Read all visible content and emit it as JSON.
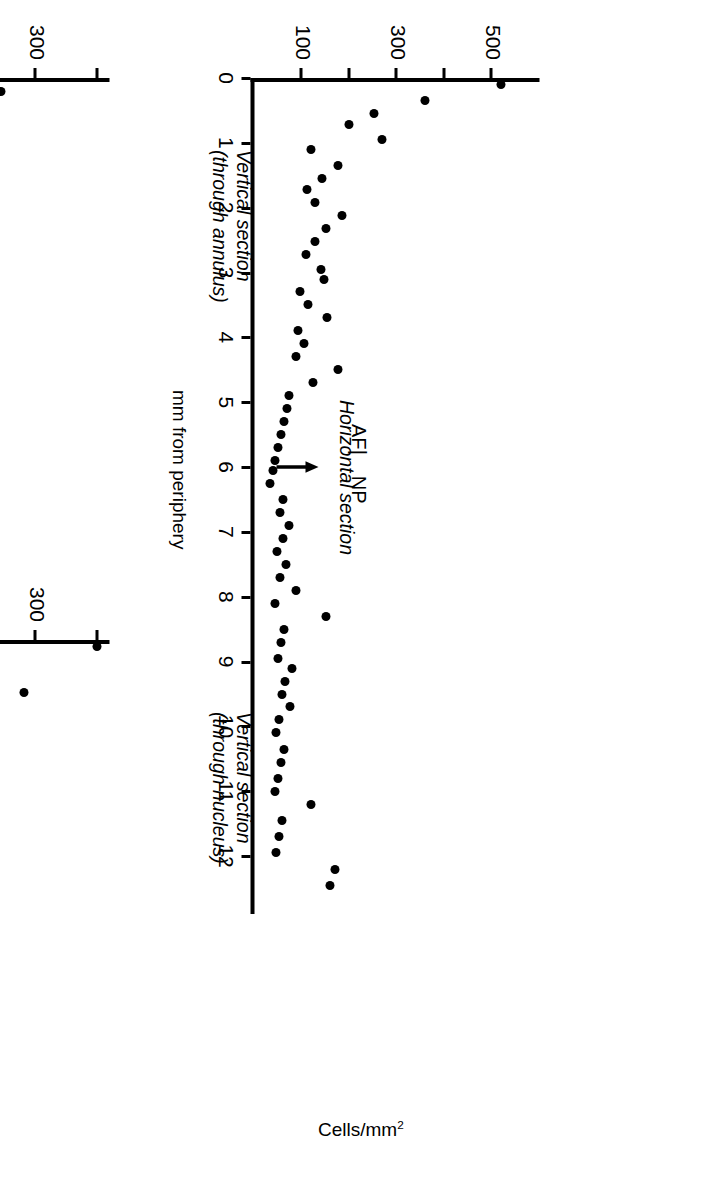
{
  "figure": {
    "global_y_axis_label": "Cells/mm",
    "global_y_axis_label_sup": "2",
    "x_axis_label": "mm from periphery"
  },
  "chart_data": [
    {
      "id": "vertical-annulus",
      "type": "scatter",
      "title": "Vertical section\n(through annulus)",
      "title_line1": "Vertical section",
      "title_line2": "(through annulus)",
      "xlabel": "",
      "ylabel": "Cells/mm2",
      "xlim": [
        0,
        5.2
      ],
      "ylim": [
        0,
        420
      ],
      "xticks": [
        0,
        1,
        2,
        3,
        4,
        5
      ],
      "xticklabels": [
        "0",
        "1",
        "2",
        "3",
        "4",
        "5"
      ],
      "yticks": [
        100,
        200,
        300,
        400
      ],
      "yticklabels": [
        "100",
        "",
        "300",
        ""
      ],
      "grid": false,
      "legend": false,
      "annotations": [
        {
          "text": "CP",
          "x": 0.72,
          "y": 150,
          "name": "cp-label"
        },
        {
          "text": "AF",
          "x": 1.3,
          "y": 150,
          "name": "af-label"
        },
        {
          "text": "arrow",
          "x": 1.0,
          "y": 95,
          "name": "boundary-arrow"
        }
      ],
      "x": [
        0.25,
        0.4,
        0.55,
        0.72,
        0.92,
        1.1,
        1.25,
        1.35,
        1.48,
        1.62,
        1.78,
        1.95,
        2.1,
        2.25,
        2.42,
        2.6,
        2.78,
        2.95,
        3.12,
        3.3,
        3.48,
        3.65,
        3.82,
        4.0,
        4.18,
        4.35,
        4.52,
        4.7
      ],
      "y": [
        245,
        148,
        143,
        128,
        118,
        110,
        72,
        75,
        78,
        82,
        86,
        95,
        58,
        62,
        66,
        70,
        74,
        78,
        62,
        66,
        70,
        74,
        66,
        50,
        54,
        58,
        62,
        66
      ],
      "values": [
        245,
        148,
        143,
        128,
        118,
        110,
        72,
        75,
        78,
        82,
        86,
        95,
        58,
        62,
        66,
        70,
        74,
        78,
        62,
        66,
        70,
        74,
        66,
        50,
        54,
        58,
        62,
        66
      ]
    },
    {
      "id": "vertical-nucleus",
      "type": "scatter",
      "title": "Vertical section\n(through nucleus)",
      "title_line1": "Vertical section",
      "title_line2": "(through nucleus)",
      "xlabel": "",
      "ylabel": "Cells/mm2",
      "xlim": [
        0,
        5.2
      ],
      "ylim": [
        0,
        420
      ],
      "xticks": [
        0,
        1,
        2,
        3,
        4,
        5
      ],
      "xticklabels": [
        "0",
        "1",
        "2",
        "3",
        "4",
        "5"
      ],
      "yticks": [
        100,
        200,
        300,
        400
      ],
      "yticklabels": [
        "100",
        "",
        "300",
        ""
      ],
      "grid": false,
      "legend": false,
      "annotations": [
        {
          "text": "CP",
          "x": 0.7,
          "y": 160,
          "name": "cp-label"
        },
        {
          "text": "NP",
          "x": 1.38,
          "y": 160,
          "name": "np-label"
        },
        {
          "text": "arrow",
          "x": 1.0,
          "y": 100,
          "name": "boundary-arrow"
        }
      ],
      "x": [
        0.12,
        0.42,
        0.55,
        0.68,
        0.95,
        1.28,
        1.48,
        1.72,
        1.95,
        2.12,
        2.32,
        2.52,
        2.78,
        2.82,
        3.02,
        3.42,
        3.55,
        3.8,
        4.0,
        4.18,
        4.38,
        4.55,
        4.75
      ],
      "y": [
        400,
        218,
        218,
        218,
        282,
        152,
        122,
        95,
        62,
        78,
        60,
        68,
        56,
        82,
        92,
        188,
        72,
        84,
        96,
        88,
        78,
        60,
        70
      ],
      "values": [
        400,
        218,
        218,
        218,
        282,
        152,
        122,
        95,
        62,
        78,
        60,
        68,
        56,
        82,
        92,
        188,
        72,
        84,
        96,
        88,
        78,
        60,
        70
      ]
    },
    {
      "id": "horizontal-section",
      "type": "scatter",
      "title": "Horizontal section",
      "title_line1": "Horizontal section",
      "title_line2": "",
      "xlabel": "mm from periphery",
      "ylabel": "Cells/mm2",
      "xlim": [
        0,
        12.8
      ],
      "ylim": [
        0,
        600
      ],
      "xticks": [
        0,
        1,
        2,
        3,
        4,
        5,
        6,
        7,
        8,
        9,
        10,
        11,
        12
      ],
      "xticklabels": [
        "0",
        "1",
        "2",
        "3",
        "4",
        "5",
        "6",
        "7",
        "8",
        "9",
        "10",
        "11",
        "12"
      ],
      "yticks": [
        100,
        200,
        300,
        400,
        500
      ],
      "yticklabels": [
        "100",
        "",
        "300",
        "",
        "500"
      ],
      "grid": false,
      "legend": false,
      "annotations": [
        {
          "text": "AF",
          "x": 5.55,
          "y": 215,
          "name": "af-label"
        },
        {
          "text": "|",
          "x": 5.95,
          "y": 215,
          "name": "divider-label"
        },
        {
          "text": "NP",
          "x": 6.35,
          "y": 215,
          "name": "np-label"
        },
        {
          "text": "arrow",
          "x": 6.0,
          "y": 140,
          "name": "boundary-arrow"
        }
      ],
      "x": [
        0.1,
        0.35,
        0.55,
        0.72,
        0.95,
        1.1,
        1.35,
        1.55,
        1.72,
        1.92,
        2.12,
        2.32,
        2.52,
        2.72,
        2.95,
        3.1,
        3.3,
        3.5,
        3.7,
        3.9,
        4.1,
        4.3,
        4.5,
        4.7,
        4.9,
        5.1,
        5.3,
        5.5,
        5.7,
        5.9,
        6.05,
        6.25,
        6.5,
        6.7,
        6.9,
        7.1,
        7.3,
        7.5,
        7.7,
        7.9,
        8.1,
        8.3,
        8.5,
        8.7,
        8.95,
        9.1,
        9.3,
        9.5,
        9.7,
        9.9,
        10.1,
        10.35,
        10.55,
        10.8,
        11.0,
        11.2,
        11.45,
        11.7,
        11.95,
        12.2,
        12.45
      ],
      "y": [
        520,
        358,
        252,
        198,
        268,
        118,
        176,
        142,
        110,
        128,
        185,
        150,
        128,
        108,
        140,
        146,
        95,
        112,
        152,
        92,
        104,
        88,
        176,
        124,
        72,
        68,
        62,
        56,
        50,
        44,
        38,
        32,
        60,
        54,
        72,
        60,
        48,
        66,
        54,
        88,
        44,
        150,
        62,
        56,
        50,
        80,
        64,
        58,
        74,
        52,
        46,
        62,
        56,
        50,
        44,
        120,
        58,
        52,
        46,
        170,
        158
      ]
    }
  ]
}
